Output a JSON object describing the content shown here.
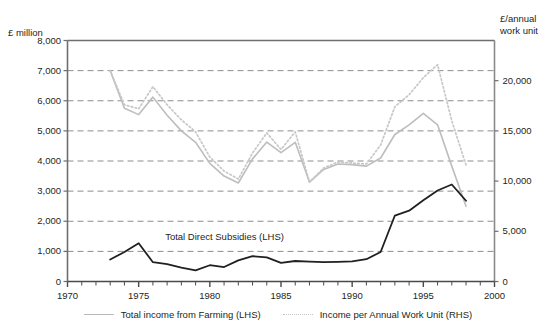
{
  "chart_data": {
    "type": "line",
    "title": "",
    "subtitle": "",
    "xlabel": "",
    "ylabel": "£ million",
    "y2label": "£/annual\nwork unit",
    "grid": true,
    "legend_position": "bottom",
    "xlim": [
      1970,
      2000
    ],
    "x_ticks": [
      1970,
      1975,
      1980,
      1985,
      1990,
      1995,
      2000
    ],
    "x_tick_labels": [
      "1970",
      "1975",
      "1980",
      "1985",
      "1990",
      "1995",
      "2000"
    ],
    "x_minor_tick_interval": 1,
    "ylim": [
      0,
      8000
    ],
    "y_ticks": [
      0,
      1000,
      2000,
      3000,
      4000,
      5000,
      6000,
      7000,
      8000
    ],
    "y_tick_labels": [
      "0",
      "1,000",
      "2,000",
      "3,000",
      "4,000",
      "5,000",
      "6,000",
      "7,000",
      "8,000"
    ],
    "y2lim": [
      0,
      24000
    ],
    "y2_ticks": [
      0,
      5000,
      10000,
      15000,
      20000
    ],
    "y2_tick_labels": [
      "0",
      "5,000",
      "10,000",
      "15,000",
      "20,000"
    ],
    "annotations": [
      {
        "text": "Total Direct Subsidies (LHS)",
        "x": 1977.0,
        "y": 1430
      }
    ],
    "series": [
      {
        "name": "Total income from Farming (LHS)",
        "axis": "left",
        "style": "solid",
        "color": "#bdbdbd",
        "x": [
          1973,
          1974,
          1975,
          1976,
          1977,
          1978,
          1979,
          1980,
          1981,
          1982,
          1983,
          1984,
          1985,
          1986,
          1987,
          1988,
          1989,
          1990,
          1991,
          1992,
          1993,
          1994,
          1995,
          1996,
          1997,
          1998
        ],
        "values": [
          7000,
          5750,
          5540,
          6120,
          5520,
          5000,
          4620,
          3920,
          3500,
          3270,
          4070,
          4630,
          4280,
          4620,
          3300,
          3720,
          3900,
          3880,
          3830,
          4100,
          4880,
          5200,
          5580,
          5200,
          3830,
          2500
        ]
      },
      {
        "name": "Income per Annual Work Unit (RHS)",
        "axis": "right",
        "style": "dotted",
        "color": "#c7c7c7",
        "x": [
          1973,
          1974,
          1975,
          1976,
          1977,
          1978,
          1979,
          1980,
          1981,
          1982,
          1983,
          1984,
          1985,
          1986,
          1987,
          1988,
          1989,
          1990,
          1991,
          1992,
          1993,
          1994,
          1995,
          1996,
          1997,
          1998
        ],
        "values": [
          21000,
          17600,
          17200,
          19400,
          17600,
          16100,
          14900,
          12400,
          11000,
          10200,
          12800,
          14800,
          13150,
          14900,
          9900,
          11300,
          11900,
          11800,
          11700,
          13600,
          17400,
          18600,
          20300,
          21600,
          16000,
          11600
        ]
      },
      {
        "name": "Total Direct Subsidies (LHS)",
        "axis": "left",
        "style": "solid",
        "color": "#231f20",
        "x": [
          1973,
          1974,
          1975,
          1976,
          1977,
          1978,
          1979,
          1980,
          1981,
          1982,
          1983,
          1984,
          1985,
          1986,
          1987,
          1988,
          1989,
          1990,
          1991,
          1992,
          1993,
          1994,
          1995,
          1996,
          1997,
          1998
        ],
        "values": [
          730,
          980,
          1270,
          640,
          580,
          460,
          370,
          540,
          480,
          700,
          840,
          800,
          620,
          680,
          660,
          640,
          650,
          670,
          740,
          980,
          2190,
          2350,
          2700,
          3020,
          3220,
          2680
        ]
      }
    ]
  },
  "axes": {
    "left_title": "£ million",
    "right_title": "£/annual\nwork unit"
  },
  "legend": {
    "items": [
      {
        "label": "Total income from Farming (LHS)",
        "style": "solid",
        "color": "#bdbdbd"
      },
      {
        "label": "Income per Annual Work Unit (RHS)",
        "style": "dotted",
        "color": "#c3c3c3"
      }
    ]
  }
}
